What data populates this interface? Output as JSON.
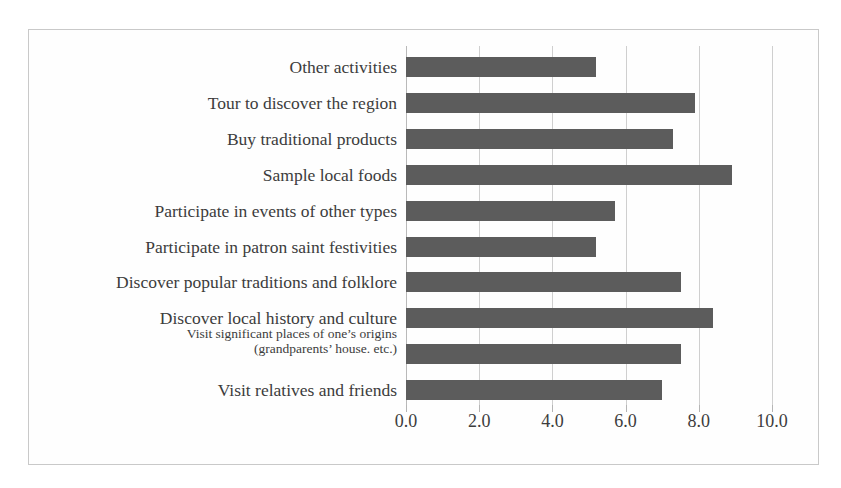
{
  "figure": {
    "frame_border_color": "#c9c9c9",
    "background_color": "#ffffff",
    "bar_color": "#5c5c5c",
    "gridline_color": "#cfcfcf",
    "text_color": "#3c3c3c"
  },
  "chart_data": {
    "type": "bar",
    "orientation": "horizontal",
    "title": "",
    "xlabel": "",
    "ylabel": "",
    "xlim": [
      0.0,
      10.0
    ],
    "grid": true,
    "legend": "none",
    "xticks": [
      "0.0",
      "2.0",
      "4.0",
      "6.0",
      "8.0",
      "10.0"
    ],
    "xtick_values": [
      0.0,
      2.0,
      4.0,
      6.0,
      8.0,
      10.0
    ],
    "categories": [
      "Other activities",
      "Tour to discover the region",
      "Buy traditional products",
      "Sample local foods",
      "Participate in events of other types",
      "Participate in patron saint festivities",
      "Discover popular traditions and folklore",
      "Discover local history and culture",
      "Visit significant places of one’s origins (grandparents’ house. etc.)",
      "Visit relatives and friends"
    ],
    "category_lines": [
      [
        "Other activities"
      ],
      [
        "Tour to discover the region"
      ],
      [
        "Buy traditional products"
      ],
      [
        "Sample local foods"
      ],
      [
        "Participate in events of other types"
      ],
      [
        "Participate in patron saint festivities"
      ],
      [
        "Discover popular traditions and folklore"
      ],
      [
        "Discover local history and culture"
      ],
      [
        "Visit significant places of one’s origins",
        "(grandparents’ house. etc.)"
      ],
      [
        "Visit relatives and friends"
      ]
    ],
    "values": [
      5.2,
      7.9,
      7.3,
      8.9,
      5.7,
      5.2,
      7.5,
      8.4,
      7.5,
      7.0
    ]
  }
}
